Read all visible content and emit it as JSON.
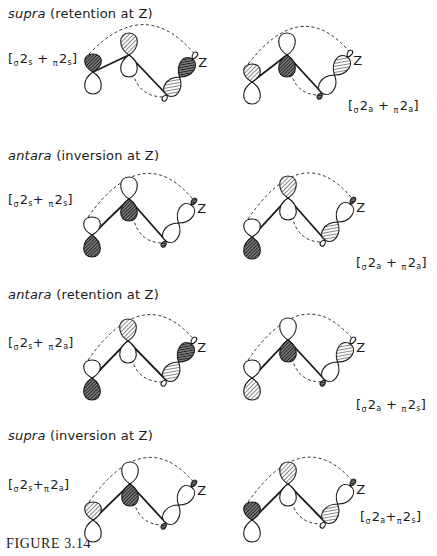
{
  "figure": {
    "caption": "FIGURE 3.14",
    "colors": {
      "ink": "#1a1a1a",
      "background": "#ffffff",
      "hatch_light": "#555555",
      "hatch_dark": "#222222"
    },
    "rows": [
      {
        "heading": {
          "mode": "supra",
          "detail": "(retention at Z)"
        },
        "diagrams": [
          {
            "label": {
              "a": "2",
              "a_pre": "σ",
              "a_sub": "s",
              "b": "2",
              "b_pre": "π",
              "b_sub": "s"
            },
            "c1": [
              93,
              72
            ],
            "c2": [
              129,
              55
            ],
            "c3": [
              167,
              95
            ],
            "lobes": {
              "c1_up": "dark",
              "c1_down": "empty",
              "c2_up": "hatch",
              "c2_down": "empty",
              "z_inner": "hatch",
              "z_outer": "dark",
              "z_tip": "empty",
              "c3_back": "empty"
            },
            "zdir": "up",
            "z_label": "Z"
          },
          {
            "label": {
              "a": "2",
              "a_pre": "σ",
              "a_sub": "a",
              "b": "2",
              "b_pre": "π",
              "b_sub": "a"
            },
            "c1": [
              252,
              82
            ],
            "c2": [
              287,
              55
            ],
            "c3": [
              322,
              93
            ],
            "lobes": {
              "c1_up": "hatch",
              "c1_down": "empty",
              "c2_up": "empty",
              "c2_down": "dark",
              "z_inner": "empty",
              "z_outer": "hatch",
              "z_tip": "empty",
              "c3_back": "dark"
            },
            "zdir": "up",
            "z_label": "Z"
          }
        ]
      },
      {
        "heading": {
          "mode": "antara",
          "detail": "(inversion at Z)"
        },
        "diagrams": [
          {
            "label": {
              "a": "2",
              "a_pre": "σ",
              "a_sub": "s",
              "b": "2",
              "b_pre": "π",
              "b_sub": "s"
            },
            "c1": [
              92,
              235
            ],
            "c2": [
              129,
              199
            ],
            "c3": [
              166,
              241
            ],
            "lobes": {
              "c1_up": "empty",
              "c1_down": "dark",
              "c2_up": "empty",
              "c2_down": "dark",
              "z_inner": "empty",
              "z_outer": "empty",
              "z_tip": "dark",
              "c3_back": "dark"
            },
            "zdir": "up",
            "z_label": "Z"
          },
          {
            "label": {
              "a": "2",
              "a_pre": "σ",
              "a_sub": "a",
              "b": "2",
              "b_pre": "π",
              "b_sub": "a"
            },
            "c1": [
              252,
              237
            ],
            "c2": [
              288,
              198
            ],
            "c3": [
              325,
              240
            ],
            "lobes": {
              "c1_up": "empty",
              "c1_down": "dark",
              "c2_up": "hatch",
              "c2_down": "empty",
              "z_inner": "hatch",
              "z_outer": "empty",
              "z_tip": "dark",
              "c3_back": "empty"
            },
            "zdir": "up",
            "z_label": "Z"
          }
        ]
      },
      {
        "heading": {
          "mode": "antara",
          "detail": "(retention at Z)"
        },
        "diagrams": [
          {
            "label": {
              "a": "2",
              "a_pre": "σ",
              "a_sub": "s",
              "b": "2",
              "b_pre": "π",
              "b_sub": "a"
            },
            "c1": [
              92,
              378
            ],
            "c2": [
              128,
              341
            ],
            "c3": [
              166,
              380
            ],
            "lobes": {
              "c1_up": "empty",
              "c1_down": "dark",
              "c2_up": "hatch",
              "c2_down": "empty",
              "z_inner": "hatch",
              "z_outer": "dark",
              "z_tip": "empty",
              "c3_back": "empty"
            },
            "zdir": "up",
            "z_label": "Z"
          },
          {
            "label": {
              "a": "2",
              "a_pre": "σ",
              "a_sub": "a",
              "b": "2",
              "b_pre": "π",
              "b_sub": "s"
            },
            "c1": [
              252,
              378
            ],
            "c2": [
              288,
              340
            ],
            "c3": [
              325,
              380
            ],
            "lobes": {
              "c1_up": "empty",
              "c1_down": "hatch",
              "c2_up": "empty",
              "c2_down": "dark",
              "z_inner": "empty",
              "z_outer": "hatch",
              "z_tip": "empty",
              "c3_back": "dark"
            },
            "zdir": "up",
            "z_label": "Z"
          }
        ]
      },
      {
        "heading": {
          "mode": "supra",
          "detail": "(inversion at Z)"
        },
        "diagrams": [
          {
            "label": {
              "a": "2",
              "a_pre": "σ",
              "a_sub": "s",
              "b": "2",
              "b_pre": "π",
              "b_sub": "a"
            },
            "c1": [
              93,
              520
            ],
            "c2": [
              130,
              484
            ],
            "c3": [
              166,
              523
            ],
            "lobes": {
              "c1_up": "hatch",
              "c1_down": "empty",
              "c2_up": "empty",
              "c2_down": "dark",
              "z_inner": "empty",
              "z_outer": "empty",
              "z_tip": "dark",
              "c3_back": "dark"
            },
            "zdir": "up",
            "z_label": "Z"
          },
          {
            "label": {
              "a": "2",
              "a_pre": "σ",
              "a_sub": "a",
              "b": "2",
              "b_pre": "π",
              "b_sub": "s"
            },
            "c1": [
              252,
              520
            ],
            "c2": [
              288,
              484
            ],
            "c3": [
              325,
              522
            ],
            "lobes": {
              "c1_up": "dark",
              "c1_down": "empty",
              "c2_up": "hatch",
              "c2_down": "empty",
              "z_inner": "hatch",
              "z_outer": "empty",
              "z_tip": "dark",
              "c3_back": "empty"
            },
            "zdir": "up",
            "z_label": "Z"
          }
        ]
      }
    ]
  }
}
